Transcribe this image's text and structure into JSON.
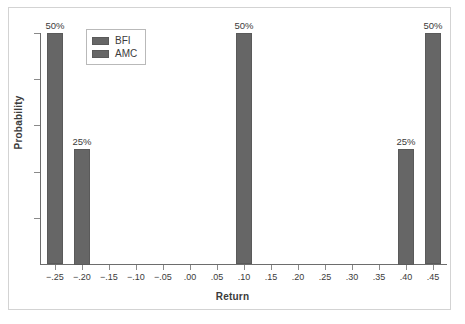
{
  "chart_data": {
    "type": "bar",
    "title": "",
    "xlabel": "Return",
    "ylabel": "Probability",
    "xlim": [
      -0.275,
      0.475
    ],
    "ylim": [
      0,
      0.5
    ],
    "grid": false,
    "legend_position": "top-left-inside",
    "x_tick_labels": [
      "−.25",
      "−.20",
      "−.15",
      "−.10",
      "−.05",
      ".00",
      ".05",
      ".10",
      ".15",
      ".20",
      ".25",
      ".30",
      ".35",
      ".40",
      ".45"
    ],
    "x_tick_values": [
      -0.25,
      -0.2,
      -0.15,
      -0.1,
      -0.05,
      0.0,
      0.05,
      0.1,
      0.15,
      0.2,
      0.25,
      0.3,
      0.35,
      0.4,
      0.45
    ],
    "y_tick_values": [
      0,
      0.1,
      0.2,
      0.3,
      0.4,
      0.5
    ],
    "y_tick_labels": [
      "",
      "",
      "",
      "",
      "",
      ""
    ],
    "series": [
      {
        "name": "BFI",
        "color": "#666666",
        "points": [
          {
            "x": -0.25,
            "y": 0.5,
            "label": "50%"
          },
          {
            "x": 0.1,
            "y": 0.5,
            "label": "50%"
          },
          {
            "x": 0.45,
            "y": 0.5,
            "label": "50%"
          }
        ]
      },
      {
        "name": "AMC",
        "color": "#666666",
        "points": [
          {
            "x": -0.2,
            "y": 0.25,
            "label": "25%"
          },
          {
            "x": 0.4,
            "y": 0.25,
            "label": "25%"
          }
        ]
      }
    ],
    "bars": [
      {
        "series": "BFI",
        "x": -0.25,
        "value": 0.5,
        "label": "50%"
      },
      {
        "series": "AMC",
        "x": -0.2,
        "value": 0.25,
        "label": "25%"
      },
      {
        "series": "BFI",
        "x": 0.1,
        "value": 0.5,
        "label": "50%"
      },
      {
        "series": "AMC",
        "x": 0.4,
        "value": 0.25,
        "label": "25%"
      },
      {
        "series": "BFI",
        "x": 0.45,
        "value": 0.5,
        "label": "50%"
      }
    ]
  },
  "legend": {
    "items": [
      {
        "label": "BFI",
        "color": "#666666"
      },
      {
        "label": "AMC",
        "color": "#666666"
      }
    ]
  },
  "axes": {
    "x_title": "Return",
    "y_title": "Probability"
  },
  "colors": {
    "bar_fill": "#666666",
    "bar_stroke": "#5a5a5a",
    "axis": "#6d6d6d",
    "frame": "#d3d3d3",
    "text": "#3b3b3b"
  }
}
